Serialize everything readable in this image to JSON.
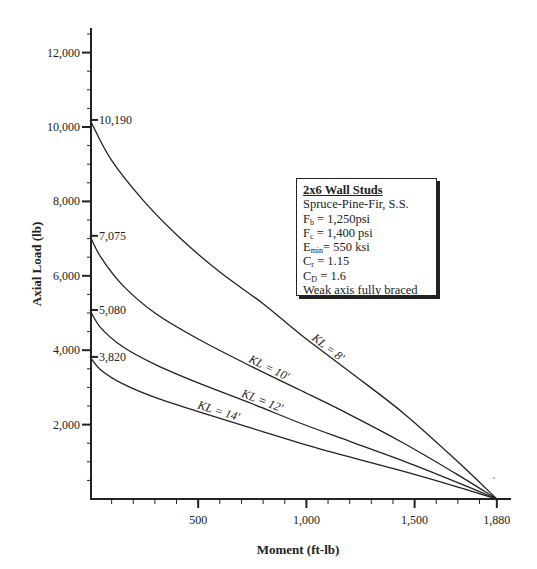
{
  "chart_data": {
    "type": "line",
    "title": "",
    "xlabel": "Moment (ft-lb)",
    "ylabel": "Axial Load (lb)",
    "xlim": [
      0,
      1930
    ],
    "ylim": [
      0,
      12800
    ],
    "x_ticks": [
      500,
      1000,
      1500,
      1880
    ],
    "x_tick_labels": [
      "500",
      "1,000",
      "1,500",
      "1,880"
    ],
    "y_ticks": [
      2000,
      4000,
      6000,
      8000,
      10000,
      12000
    ],
    "y_tick_labels": [
      "2,000",
      "4,000",
      "6,000",
      "8,000",
      "10,000",
      "12,000"
    ],
    "grid": false,
    "annotations": [
      {
        "text": "10,190",
        "y": 10190
      },
      {
        "text": "7,075",
        "y": 7075
      },
      {
        "text": "5,080",
        "y": 5080
      },
      {
        "text": "3,820",
        "y": 3820
      }
    ],
    "series": [
      {
        "name": "KL = 8'",
        "label": "KL = 8'",
        "x": [
          0,
          100,
          250,
          416,
          600,
          800,
          970,
          1200,
          1450,
          1700,
          1880
        ],
        "y": [
          10190,
          9100,
          8000,
          7016,
          6100,
          5250,
          4435,
          3420,
          2300,
          1000,
          0
        ]
      },
      {
        "name": "KL = 10'",
        "label": "KL = 10'",
        "x": [
          0,
          50,
          150,
          300,
          500,
          750,
          970,
          1200,
          1450,
          1700,
          1880
        ],
        "y": [
          7075,
          6500,
          5750,
          5000,
          4300,
          3550,
          2930,
          2270,
          1500,
          650,
          0
        ]
      },
      {
        "name": "KL = 12'",
        "label": "KL = 12'",
        "x": [
          0,
          50,
          150,
          300,
          500,
          750,
          970,
          1200,
          1450,
          1700,
          1880
        ],
        "y": [
          5080,
          4600,
          4100,
          3620,
          3120,
          2560,
          2043,
          1550,
          1020,
          440,
          0
        ]
      },
      {
        "name": "KL = 14'",
        "label": "KL = 14'",
        "x": [
          0,
          50,
          150,
          300,
          500,
          750,
          970,
          1200,
          1450,
          1700,
          1880
        ],
        "y": [
          3820,
          3470,
          3100,
          2730,
          2350,
          1900,
          1505,
          1130,
          740,
          320,
          0
        ]
      }
    ],
    "legend": {
      "title": "2x6 Wall Studs",
      "lines": [
        {
          "main": "Spruce-Pine-Fir, S.S.",
          "sub": "",
          "rest": ""
        },
        {
          "main": "F",
          "sub": "b",
          "rest": " = 1,250psi"
        },
        {
          "main": "F",
          "sub": "c",
          "rest": " = 1,400 psi"
        },
        {
          "main": "E",
          "sub": "min",
          "rest": "= 550 ksi"
        },
        {
          "main": "C",
          "sub": "r",
          "rest": " = 1.15"
        },
        {
          "main": "C",
          "sub": "D",
          "rest": " = 1.6"
        },
        {
          "main": "Weak axis fully braced",
          "sub": "",
          "rest": ""
        }
      ],
      "position": "upper-right"
    }
  }
}
